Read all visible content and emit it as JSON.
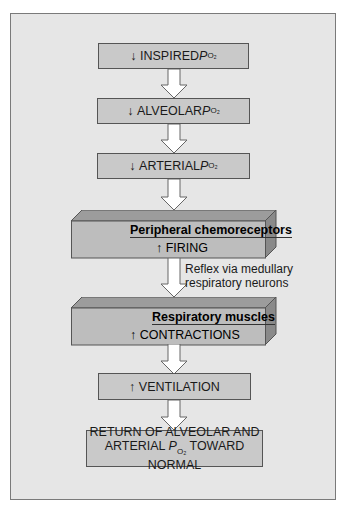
{
  "diagram": {
    "boxes": [
      {
        "id": "inspired",
        "arrow": "↓",
        "text": "INSPIRED ",
        "p": "P",
        "sub": "O₂"
      },
      {
        "id": "alveolar",
        "arrow": "↓",
        "text": "ALVEOLAR ",
        "p": "P",
        "sub": "O₂"
      },
      {
        "id": "arterial",
        "arrow": "↓",
        "text": "ARTERIAL ",
        "p": "P",
        "sub": "O₂"
      },
      {
        "id": "chemo",
        "title": "Peripheral chemoreceptors",
        "arrow": "↑",
        "text": "FIRING"
      },
      {
        "id": "muscles",
        "title": "Respiratory muscles",
        "arrow": "↑",
        "text": "CONTRACTIONS"
      },
      {
        "id": "ventilation",
        "arrow": "↑",
        "text": "VENTILATION"
      },
      {
        "id": "return",
        "line1": "RETURN OF ALVEOLAR AND",
        "line2a": "ARTERIAL ",
        "p": "P",
        "sub": "O₂",
        "line2b": " TOWARD NORMAL"
      }
    ],
    "note_line1": "Reflex via medullary",
    "note_line2": "respiratory neurons"
  }
}
